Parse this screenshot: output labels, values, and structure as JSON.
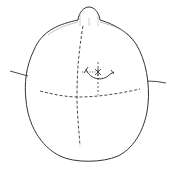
{
  "diagram": {
    "title": "Superior view of head with surgical landmark lines",
    "colors": {
      "stroke": "#333333",
      "background": "#ffffff",
      "shade": "#9a9a9a"
    },
    "elements": {
      "head_outline": "head-outline",
      "nose": "nose",
      "left_ear": "left-ear",
      "right_ear": "right-ear",
      "midline": "dashed-sagittal-midline",
      "coronal_line": "dashed-coronal-line",
      "incision": "curved-incision",
      "target_point": "asterisk-target-point",
      "guide_vertical": "dashed-vertical-guide",
      "guide_horizontal": "dotted-horizontal-guide"
    }
  }
}
